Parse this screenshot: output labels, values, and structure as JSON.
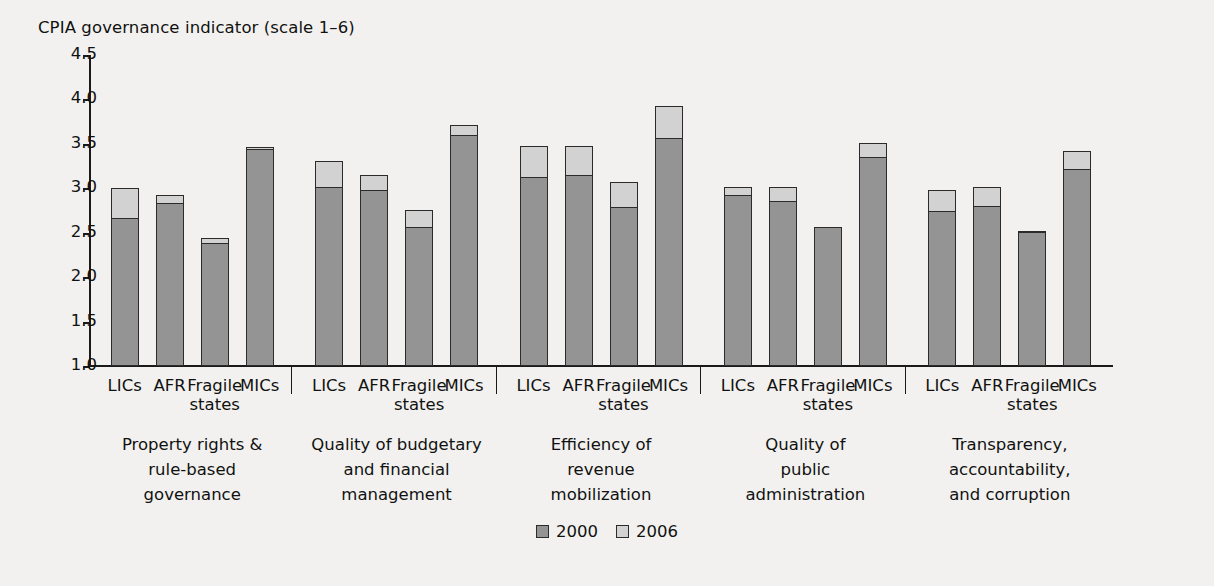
{
  "chart_data": {
    "type": "bar",
    "title": "CPIA governance indicator (scale 1–6)",
    "xlabel": "",
    "ylabel": "",
    "ylim": [
      1.0,
      4.5
    ],
    "ytick_labels": [
      "4.5",
      "4.0",
      "3.5",
      "3.0",
      "2.5",
      "2.0",
      "1.5",
      "1.0"
    ],
    "ytick_values": [
      4.5,
      4.0,
      3.5,
      3.0,
      2.5,
      2.0,
      1.5,
      1.0
    ],
    "grid": false,
    "stacked": true,
    "stack_note": "Each bar is drawn from the baseline 1.0; dark segment top = 2000 value, light segment top = 2006 value",
    "legend_position": "bottom-center",
    "series": [
      {
        "name": "2000",
        "color": "#949494"
      },
      {
        "name": "2006",
        "color": "#d2d2d2"
      }
    ],
    "categories": [
      "LICs",
      "AFR",
      "Fragile states",
      "MICs"
    ],
    "groups": [
      {
        "label_lines": [
          "Property rights &",
          "rule-based",
          "governance"
        ],
        "bars": [
          {
            "category": "LICs",
            "v2000": 2.67,
            "v2006": 3.0
          },
          {
            "category": "AFR",
            "v2000": 2.84,
            "v2006": 2.92
          },
          {
            "category": "Fragile states",
            "v2000": 2.38,
            "v2006": 2.44
          },
          {
            "category": "MICs",
            "v2000": 3.44,
            "v2006": 3.46
          }
        ]
      },
      {
        "label_lines": [
          "Quality of budgetary",
          "and financial",
          "management"
        ],
        "bars": [
          {
            "category": "LICs",
            "v2000": 3.01,
            "v2006": 3.31
          },
          {
            "category": "AFR",
            "v2000": 2.98,
            "v2006": 3.15
          },
          {
            "category": "Fragile states",
            "v2000": 2.56,
            "v2006": 2.76
          },
          {
            "category": "MICs",
            "v2000": 3.6,
            "v2006": 3.71
          }
        ]
      },
      {
        "label_lines": [
          "Efficiency of",
          "revenue",
          "mobilization"
        ],
        "bars": [
          {
            "category": "LICs",
            "v2000": 3.13,
            "v2006": 3.48
          },
          {
            "category": "AFR",
            "v2000": 3.15,
            "v2006": 3.48
          },
          {
            "category": "Fragile states",
            "v2000": 2.79,
            "v2006": 3.07
          },
          {
            "category": "MICs",
            "v2000": 3.57,
            "v2006": 3.93
          }
        ]
      },
      {
        "label_lines": [
          "Quality of",
          "public",
          "administration"
        ],
        "bars": [
          {
            "category": "LICs",
            "v2000": 2.92,
            "v2006": 3.02
          },
          {
            "category": "AFR",
            "v2000": 2.86,
            "v2006": 3.01
          },
          {
            "category": "Fragile states",
            "v2000": 2.56,
            "v2006": 2.57
          },
          {
            "category": "MICs",
            "v2000": 3.35,
            "v2006": 3.51
          }
        ]
      },
      {
        "label_lines": [
          "Transparency,",
          "accountability,",
          "and corruption"
        ],
        "bars": [
          {
            "category": "LICs",
            "v2000": 2.74,
            "v2006": 2.98
          },
          {
            "category": "AFR",
            "v2000": 2.8,
            "v2006": 3.01
          },
          {
            "category": "Fragile states",
            "v2000": 2.51,
            "v2006": 2.52
          },
          {
            "category": "MICs",
            "v2000": 3.22,
            "v2006": 3.42
          }
        ]
      }
    ]
  },
  "colors": {
    "background": "#f2f1ef",
    "axis": "#1a1a1a",
    "series_2000": "#949494",
    "series_2006": "#d2d2d2",
    "bar_outline": "#2b2b2b",
    "text": "#111111"
  },
  "legend": {
    "entries": [
      {
        "label": "2000",
        "swatch": "#949494"
      },
      {
        "label": "2006",
        "swatch": "#d2d2d2"
      }
    ]
  }
}
